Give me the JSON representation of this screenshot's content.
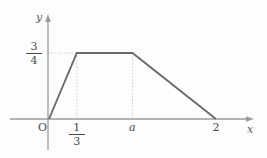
{
  "figure": {
    "kind": "piecewise-linear-graph",
    "background_color": "#fdfdfd",
    "curve_color": "#6a6a6a",
    "axis_color": "#9a9a9a",
    "guide_color": "#cccccc",
    "text_color": "#4a4a4a"
  },
  "axes": {
    "x_label": "x",
    "y_label": "y",
    "origin_label": "O"
  },
  "ticks": {
    "x": [
      {
        "id": "one-third",
        "type": "fraction",
        "numerator": "1",
        "denominator": "3",
        "value": 0.3333
      },
      {
        "id": "a",
        "type": "symbol",
        "label": "a",
        "value": 1.0
      },
      {
        "id": "two",
        "type": "number",
        "label": "2",
        "value": 2.0
      }
    ],
    "y": [
      {
        "id": "three-quarters",
        "type": "fraction",
        "numerator": "3",
        "denominator": "4",
        "value": 0.75
      }
    ]
  },
  "chart_data": {
    "type": "line",
    "title": "",
    "subtitle": "",
    "xlabel": "x",
    "ylabel": "y",
    "grid": false,
    "legend": null,
    "xlim": [
      0,
      2.2
    ],
    "ylim": [
      0,
      0.95
    ],
    "xticks": [
      "1/3",
      "a",
      "2"
    ],
    "xtick_values": [
      0.3333,
      1.0,
      2.0
    ],
    "yticks": [
      "3/4"
    ],
    "ytick_values": [
      0.75
    ],
    "series": [
      {
        "name": "f(x)",
        "x": [
          0,
          0.3333,
          1.0,
          2.0
        ],
        "values": [
          0,
          0.75,
          0.75,
          0
        ],
        "points": [
          {
            "x": 0,
            "y": 0,
            "x_label": "O",
            "y_label": "0"
          },
          {
            "x": 0.3333,
            "y": 0.75,
            "x_label": "1/3",
            "y_label": "3/4"
          },
          {
            "x": 1.0,
            "y": 0.75,
            "x_label": "a",
            "y_label": "3/4"
          },
          {
            "x": 2.0,
            "y": 0,
            "x_label": "2",
            "y_label": "0"
          }
        ]
      }
    ],
    "annotations": [
      {
        "type": "guide-line",
        "orientation": "horizontal",
        "at": 0.75,
        "from_x": 0,
        "to_x": 0.3333,
        "style": "dotted"
      },
      {
        "type": "guide-line",
        "orientation": "vertical",
        "at": 0.3333,
        "from_y": 0,
        "to_y": 0.75,
        "style": "dotted"
      },
      {
        "type": "guide-line",
        "orientation": "vertical",
        "at": 1.0,
        "from_y": 0,
        "to_y": 0.75,
        "style": "dotted"
      }
    ]
  }
}
